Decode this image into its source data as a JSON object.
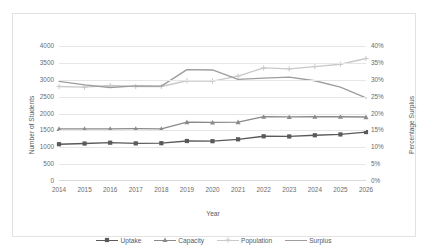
{
  "chart_data": {
    "type": "line",
    "title": "",
    "xlabel": "Year",
    "ylabel": "Number of Students",
    "y2label": "Percentage Surplus",
    "grid": true,
    "legend_position": "bottom",
    "categories": [
      "2014",
      "2015",
      "2016",
      "2017",
      "2018",
      "2019",
      "2020",
      "2021",
      "2022",
      "2023",
      "2024",
      "2025",
      "2026"
    ],
    "ylim": [
      0,
      4000
    ],
    "yticks": [
      "0",
      "500",
      "1000",
      "1500",
      "2000",
      "2500",
      "3000",
      "3500",
      "4000"
    ],
    "ytick_values": [
      0,
      500,
      1000,
      1500,
      2000,
      2500,
      3000,
      3500,
      4000
    ],
    "y2lim": [
      0,
      40
    ],
    "y2ticks": [
      "0%",
      "5%",
      "10%",
      "15%",
      "20%",
      "25%",
      "30%",
      "35%",
      "40%"
    ],
    "y2tick_values": [
      0,
      5,
      10,
      15,
      20,
      25,
      30,
      35,
      40
    ],
    "series": [
      {
        "name": "Uptake",
        "axis": "left",
        "marker": "square",
        "color": "#5a5a5a",
        "values": [
          1090,
          1110,
          1135,
          1115,
          1120,
          1185,
          1180,
          1235,
          1325,
          1320,
          1355,
          1380,
          1450
        ]
      },
      {
        "name": "Capacity",
        "axis": "left",
        "marker": "triangle",
        "color": "#8a8a8a",
        "values": [
          1545,
          1545,
          1545,
          1550,
          1545,
          1745,
          1735,
          1745,
          1905,
          1900,
          1905,
          1905,
          1895
        ]
      },
      {
        "name": "Population",
        "axis": "right",
        "marker": "plus",
        "color": "#c9c9c9",
        "values": [
          28.0,
          27.8,
          28.3,
          28.0,
          28.0,
          29.7,
          29.6,
          31.1,
          33.5,
          33.2,
          33.9,
          34.6,
          36.3
        ]
      },
      {
        "name": "Surplus",
        "axis": "right",
        "marker": "none",
        "color": "#9d9d9d",
        "values": [
          29.5,
          28.5,
          27.7,
          28.2,
          28.1,
          33.0,
          32.9,
          30.1,
          30.5,
          30.8,
          29.7,
          27.8,
          24.6
        ]
      }
    ]
  },
  "legend": {
    "items": [
      {
        "label": "Uptake"
      },
      {
        "label": "Capacity"
      },
      {
        "label": "Population"
      },
      {
        "label": "Surplus"
      }
    ]
  }
}
